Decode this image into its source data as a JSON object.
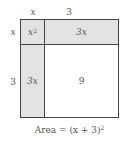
{
  "diagram": {
    "type": "area-model",
    "top_labels": {
      "left": "x",
      "right": "3"
    },
    "side_labels": {
      "top": "x",
      "bottom": "3"
    },
    "cells": {
      "top_left": {
        "base": "x",
        "exponent": "2"
      },
      "top_right": "3x",
      "bottom_left": "3x",
      "bottom_right": "9"
    },
    "caption": {
      "text": "Area = (x + 3)",
      "exponent": "2"
    },
    "colors": {
      "shaded": "#e3e3e3",
      "unshaded": "#ffffff",
      "border": "#444444",
      "text": "#555555"
    }
  }
}
